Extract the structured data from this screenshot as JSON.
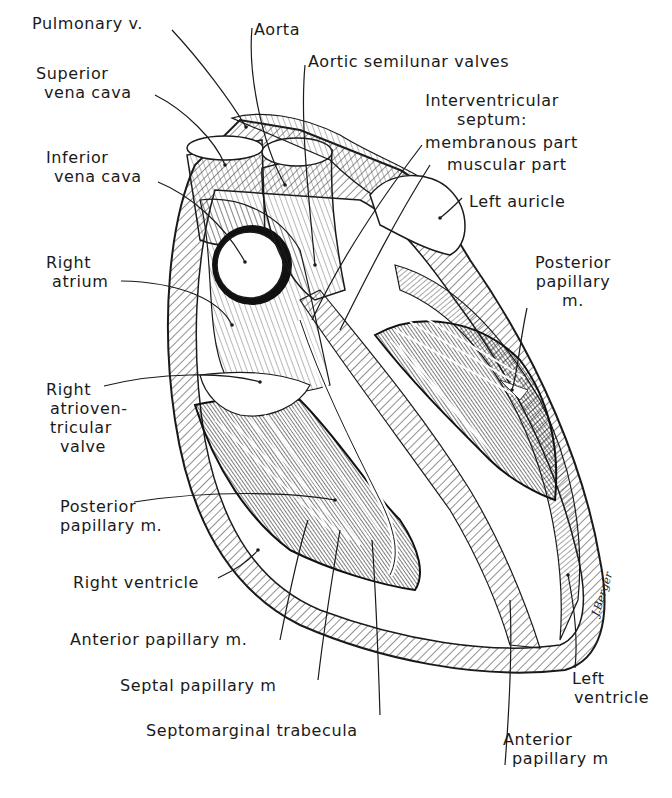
{
  "figure": {
    "signature": "J.Berger",
    "colors": {
      "ink": "#1a1a1a",
      "paper": "#ffffff",
      "shade": "#2b2b2b"
    }
  },
  "labels": {
    "pulmonary_v": [
      "Pulmonary v."
    ],
    "aorta": [
      "Aorta"
    ],
    "aortic_semilunar": [
      "Aortic semilunar valves"
    ],
    "superior_vena_cava": [
      "Superior",
      "vena cava"
    ],
    "interventricular_septum": [
      "Interventricular",
      "septum:"
    ],
    "membranous_part": [
      "membranous part"
    ],
    "muscular_part": [
      "muscular part"
    ],
    "inferior_vena_cava": [
      "Inferior",
      "vena cava"
    ],
    "left_auricle": [
      "Left auricle"
    ],
    "right_atrium": [
      "Right",
      "atrium"
    ],
    "posterior_papillary_left": [
      "Posterior",
      "papillary",
      "m."
    ],
    "right_av_valve": [
      "Right",
      "atrioven-",
      "tricular",
      "valve"
    ],
    "posterior_papillary_right": [
      "Posterior",
      "papillary m."
    ],
    "right_ventricle": [
      "Right ventricle"
    ],
    "anterior_papillary_right": [
      "Anterior papillary m."
    ],
    "septal_papillary": [
      "Septal papillary m"
    ],
    "septomarginal_trabecula": [
      "Septomarginal trabecula"
    ],
    "left_ventricle": [
      "Left",
      "ventricle"
    ],
    "anterior_papillary_left": [
      "Anterior",
      "papillary m"
    ]
  }
}
